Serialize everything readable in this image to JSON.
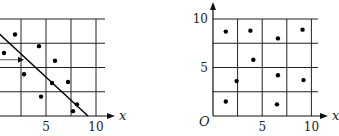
{
  "chart_data": [
    {
      "type": "scatter",
      "title": "",
      "xlabel": "x",
      "ylabel": "",
      "xlim": [
        -0.4,
        10.5
      ],
      "ylim": [
        0,
        10
      ],
      "grid": true,
      "grid_step": 2.5,
      "x_tick_labels": [
        "5",
        "10"
      ],
      "x_ticks": [
        5,
        10
      ],
      "points": [
        {
          "x": 1.9,
          "y": 8.4
        },
        {
          "x": 0.8,
          "y": 6.5
        },
        {
          "x": 4.3,
          "y": 7.2
        },
        {
          "x": 2.8,
          "y": 4.3
        },
        {
          "x": 5.9,
          "y": 5.7
        },
        {
          "x": 5.6,
          "y": 3.4
        },
        {
          "x": 7.2,
          "y": 3.5
        },
        {
          "x": 4.5,
          "y": 2.0
        },
        {
          "x": 8.1,
          "y": 1.2
        },
        {
          "x": 7.7,
          "y": 0.5
        }
      ],
      "line": {
        "x1": 0.4,
        "y1": 8.4,
        "x2": 9.2,
        "y2": 0
      },
      "marker_arrow": {
        "x_end": 2.6,
        "y": 5.8
      }
    },
    {
      "type": "scatter",
      "title": "",
      "xlabel": "x",
      "ylabel": "",
      "origin_label": "O",
      "xlim": [
        0,
        10.5
      ],
      "ylim": [
        0,
        10
      ],
      "grid": true,
      "grid_step": 2.5,
      "x_tick_labels": [
        "5",
        "10"
      ],
      "x_ticks": [
        5,
        10
      ],
      "y_tick_labels": [
        "5",
        "10"
      ],
      "y_ticks": [
        5,
        10
      ],
      "points": [
        {
          "x": 1.3,
          "y": 8.7
        },
        {
          "x": 3.8,
          "y": 8.8
        },
        {
          "x": 6.6,
          "y": 8.0
        },
        {
          "x": 9.1,
          "y": 8.9
        },
        {
          "x": 4.1,
          "y": 5.8
        },
        {
          "x": 2.4,
          "y": 3.6
        },
        {
          "x": 6.6,
          "y": 4.2
        },
        {
          "x": 9.2,
          "y": 3.7
        },
        {
          "x": 1.3,
          "y": 1.5
        },
        {
          "x": 6.5,
          "y": 1.2
        }
      ]
    }
  ]
}
